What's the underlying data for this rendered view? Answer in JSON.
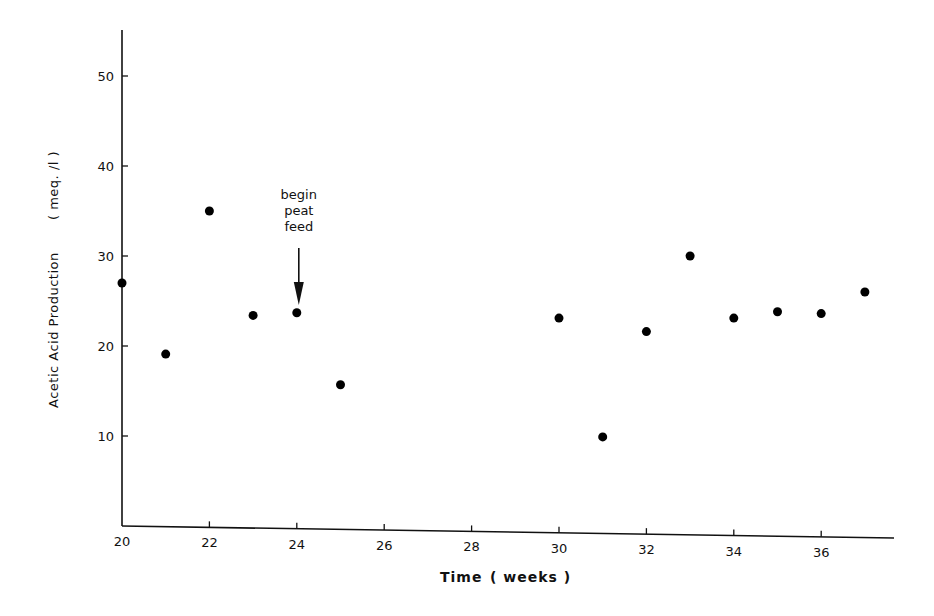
{
  "chart_data": {
    "type": "scatter",
    "title": "",
    "xlabel": "Time ( weeks )",
    "ylabel": "Acetic Acid Production ( meq. /l )",
    "xlim": [
      20,
      37.7
    ],
    "ylim": [
      0,
      55
    ],
    "x_ticks": [
      20,
      22,
      24,
      26,
      28,
      30,
      32,
      34,
      36
    ],
    "y_ticks": [
      10,
      20,
      30,
      40,
      50
    ],
    "grid": false,
    "legend": null,
    "series": [
      {
        "name": "Acetic acid",
        "points": [
          {
            "x": 20,
            "y": 27.0
          },
          {
            "x": 21,
            "y": 19.1
          },
          {
            "x": 22,
            "y": 35.0
          },
          {
            "x": 23,
            "y": 23.4
          },
          {
            "x": 24,
            "y": 23.7
          },
          {
            "x": 25,
            "y": 15.7
          },
          {
            "x": 30,
            "y": 23.1
          },
          {
            "x": 31,
            "y": 9.9
          },
          {
            "x": 32,
            "y": 21.6
          },
          {
            "x": 33,
            "y": 30.0
          },
          {
            "x": 34,
            "y": 23.1
          },
          {
            "x": 35,
            "y": 23.8
          },
          {
            "x": 36,
            "y": 23.6
          },
          {
            "x": 37,
            "y": 26.0
          }
        ]
      }
    ],
    "annotations": [
      {
        "text": [
          "begin",
          "peat",
          "feed"
        ],
        "x": 24,
        "arrow": true
      }
    ]
  },
  "labels": {
    "xlabel_main": "Time",
    "xlabel_unit": "( weeks )",
    "ylabel_main": "Acetic Acid Production",
    "ylabel_unit": "( meq. /l )",
    "annotation": [
      "begin",
      "peat",
      "feed"
    ]
  }
}
